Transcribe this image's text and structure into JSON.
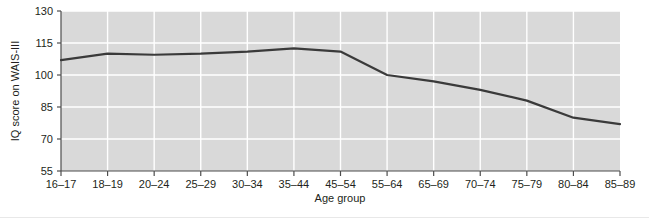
{
  "chart_data": {
    "type": "line",
    "title": "",
    "xlabel": "Age group",
    "ylabel": "IQ score on WAIS-III",
    "categories": [
      "16–17",
      "18–19",
      "20–24",
      "25–29",
      "30–34",
      "35–44",
      "45–54",
      "55–64",
      "65–69",
      "70–74",
      "75–79",
      "80–84",
      "85–89"
    ],
    "values": [
      107,
      110,
      109.5,
      110,
      111,
      112.5,
      111,
      100,
      97,
      93,
      88,
      80,
      77
    ],
    "series": [
      {
        "name": "IQ score on WAIS-III",
        "values": [
          107,
          110,
          109.5,
          110,
          111,
          112.5,
          111,
          100,
          97,
          93,
          88,
          80,
          77
        ]
      }
    ],
    "ylim": [
      55,
      130
    ],
    "yticks": [
      55,
      70,
      85,
      100,
      115,
      130
    ],
    "ytick_labels": [
      "55",
      "70",
      "85",
      "100",
      "115",
      "130"
    ],
    "grid": "both-white-on-gray",
    "legend": "none",
    "line_color": "#3a3a3a",
    "plot_bg_color": "#d9d9d9",
    "grid_color": "#ffffff",
    "text_color": "#231f20",
    "figure_bg_color": "#ffffff"
  },
  "axes": {
    "y_axis_title": "IQ score on WAIS-III",
    "x_axis_title": "Age group",
    "y_tick_labels": [
      "130",
      "115",
      "100",
      "85",
      "70",
      "55"
    ],
    "x_tick_labels": [
      "16–17",
      "18–19",
      "20–24",
      "25–29",
      "30–34",
      "35–44",
      "45–54",
      "55–64",
      "65–69",
      "70–74",
      "75–79",
      "80–84",
      "85–89"
    ]
  }
}
